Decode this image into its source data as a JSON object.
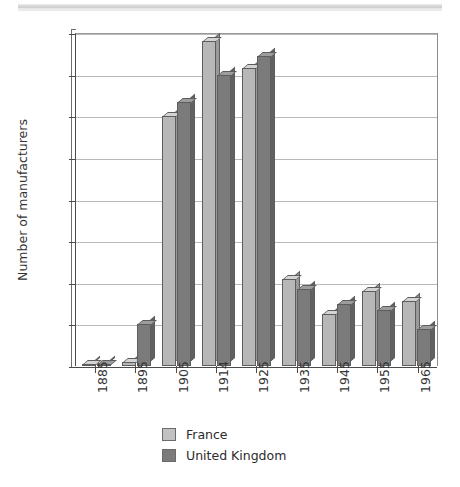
{
  "chart_data": {
    "type": "bar",
    "title": "",
    "xlabel": "",
    "ylabel": "Number of manufacturers",
    "categories": [
      "1885",
      "1895",
      "1905",
      "1914",
      "1925",
      "1935",
      "1945",
      "1955",
      "1965"
    ],
    "series": [
      {
        "name": "France",
        "color": "#b7b7b7",
        "values": [
          1,
          2,
          120,
          156,
          143,
          42,
          25,
          36,
          31
        ]
      },
      {
        "name": "United Kingdom",
        "color": "#7b7b7b",
        "values": [
          1,
          20,
          127,
          140,
          149,
          37,
          30,
          27,
          18
        ]
      }
    ],
    "ylim": [
      0,
      160
    ],
    "ytick_step": 20,
    "yticks": [
      "160",
      "140",
      "120",
      "100",
      "80",
      "60",
      "40",
      "20",
      "0"
    ],
    "grid": true,
    "legend_position": "bottom",
    "style": "3d-bar-grayscale-scan"
  },
  "legend": {
    "items": [
      {
        "label": "France",
        "color": "#b7b7b7"
      },
      {
        "label": "United Kingdom",
        "color": "#7b7b7b"
      }
    ]
  }
}
